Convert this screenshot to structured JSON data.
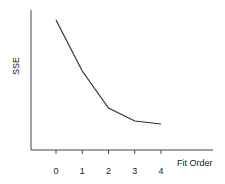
{
  "chart_data": {
    "type": "line",
    "title": "",
    "xlabel": "Fit Order",
    "ylabel": "SSE",
    "categories": [
      "0",
      "1",
      "2",
      "3",
      "4"
    ],
    "x": [
      0,
      1,
      2,
      3,
      4
    ],
    "values": [
      130,
      79,
      42,
      29,
      26
    ],
    "ylim": [
      0,
      140
    ],
    "y_ticks_shown": false,
    "grid": false,
    "legend": null,
    "line_color": "#333333"
  },
  "axis": {
    "xlabel": "Fit Order",
    "ylabel": "SSE",
    "xticks": [
      "0",
      "1",
      "2",
      "3",
      "4"
    ]
  }
}
